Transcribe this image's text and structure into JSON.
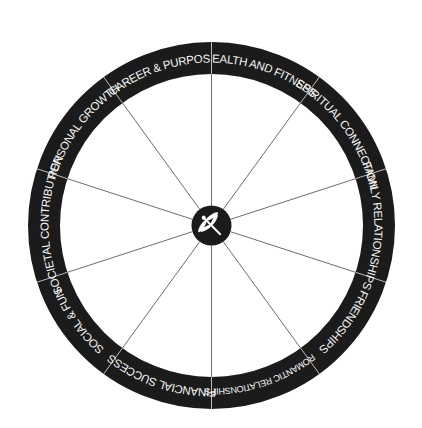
{
  "diagram": {
    "type": "life-balance-wheel",
    "center_icon": "dragonfly-icon",
    "colors": {
      "ring": "#1b1b1b",
      "ring_text": "#f4f4f4",
      "spokes": "#6e6e6e",
      "background": "#ffffff",
      "hub": "#1b1b1b",
      "hub_icon": "#ffffff"
    },
    "segments": [
      {
        "label": "HEALTH AND FITNESS"
      },
      {
        "label": "SPIRITUAL CONNECTION"
      },
      {
        "label": "FAMILY RELATIONSHIPS"
      },
      {
        "label": "FRIENDSHIPS"
      },
      {
        "label": "ROMANTIC RELATIONSHIPS"
      },
      {
        "label": "FINANCIAL SUCCESS"
      },
      {
        "label": "SOCIAL & FUN"
      },
      {
        "label": "SOCIETAL CONTRIBUTION"
      },
      {
        "label": "PERSONAL GROWTH"
      },
      {
        "label": "CAREER & PURPOSE"
      }
    ]
  }
}
